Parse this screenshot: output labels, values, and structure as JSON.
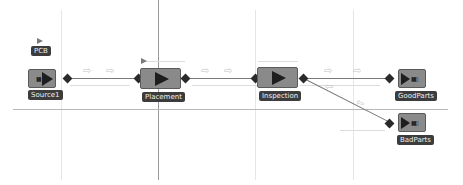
{
  "diagram": {
    "entity": {
      "label": "PCB",
      "icon": "entity-flag-icon"
    },
    "blocks": [
      {
        "id": "source1",
        "label": "Source1",
        "icon": "source-icon"
      },
      {
        "id": "placement",
        "label": "Placement",
        "icon": "server-icon"
      },
      {
        "id": "inspection",
        "label": "Inspection",
        "icon": "server-icon"
      },
      {
        "id": "goodparts",
        "label": "GoodParts",
        "icon": "sink-icon"
      },
      {
        "id": "badparts",
        "label": "BadParts",
        "icon": "sink-icon"
      }
    ],
    "flow_glyph": "⇨",
    "flow_glyph_back": "⇦",
    "colors": {
      "block_fill": "#8a8a8a",
      "label_bg": "#3c3c3c",
      "port": "#2a2a2a"
    }
  }
}
